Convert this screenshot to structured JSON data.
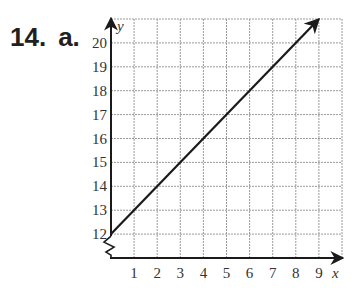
{
  "problem": {
    "number": "14.",
    "part": "a."
  },
  "colors": {
    "grid": "#9a9a9a",
    "axis": "#1a1a1a",
    "line": "#1a1a1a",
    "text": "#231f20"
  },
  "chart_data": {
    "type": "line",
    "title": "",
    "xlabel": "x",
    "ylabel": "y",
    "x_ticks": [
      "1",
      "2",
      "3",
      "4",
      "5",
      "6",
      "7",
      "8",
      "9"
    ],
    "y_ticks": [
      "12",
      "13",
      "14",
      "15",
      "16",
      "17",
      "18",
      "19",
      "20"
    ],
    "xlim": [
      0,
      10
    ],
    "ylim": [
      11,
      21
    ],
    "y_axis_break": true,
    "grid": true,
    "series": [
      {
        "name": "line",
        "x": [
          0,
          9
        ],
        "y": [
          12,
          21
        ],
        "equation": "y = x + 12",
        "arrow_end": true
      }
    ]
  }
}
